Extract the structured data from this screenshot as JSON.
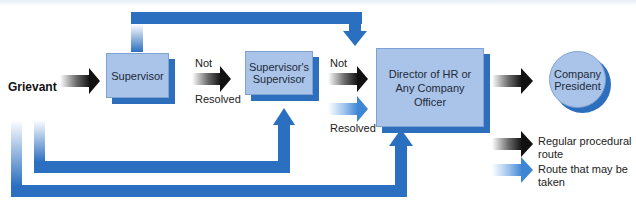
{
  "diagram": {
    "type": "flowchart",
    "start_label": "Grievant",
    "nodes": [
      {
        "id": "supervisor",
        "label": "Supervisor",
        "shape": "box"
      },
      {
        "id": "supervisors_supervisor",
        "label_line1": "Supervisor's",
        "label_line2": "Supervisor",
        "shape": "box"
      },
      {
        "id": "director",
        "label_line1": "Director of HR or",
        "label_line2": "Any Company",
        "label_line3": "Officer",
        "shape": "box"
      },
      {
        "id": "president",
        "label_line1": "Company",
        "label_line2": "President",
        "shape": "circle"
      }
    ],
    "edge_labels": {
      "not_1": "Not",
      "resolved_1": "Resolved",
      "not_2": "Not",
      "resolved_2": "Resolved"
    },
    "edges": [
      {
        "from": "grievant",
        "to": "supervisor",
        "style": "regular"
      },
      {
        "from": "supervisor",
        "to": "supervisors_supervisor",
        "style": "regular",
        "label": "Not Resolved"
      },
      {
        "from": "supervisors_supervisor",
        "to": "director",
        "style": "regular",
        "label": "Not Resolved"
      },
      {
        "from": "supervisors_supervisor",
        "to": "director",
        "style": "optional",
        "label": "Not Resolved"
      },
      {
        "from": "director",
        "to": "president",
        "style": "regular"
      },
      {
        "from": "supervisor",
        "to": "director",
        "style": "optional-bypass-top"
      },
      {
        "from": "grievant",
        "to": "supervisors_supervisor",
        "style": "optional-bypass-bottom"
      },
      {
        "from": "grievant",
        "to": "director",
        "style": "optional-bypass-bottom"
      }
    ],
    "legend": [
      {
        "key": "regular",
        "line1": "Regular procedural",
        "line2": "route"
      },
      {
        "key": "optional",
        "line1": "Route that may be",
        "line2": "taken"
      }
    ],
    "colors": {
      "box_fill": "#a9c4e8",
      "box_shadow": "#2d6fbd",
      "route_blue": "#2b6fc0",
      "regular_arrow": "#1a1a1a",
      "optional_arrow": "#4a8fd9"
    }
  }
}
